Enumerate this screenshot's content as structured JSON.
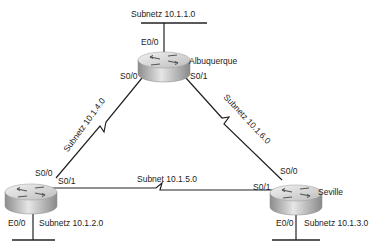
{
  "diagram": {
    "type": "network-topology",
    "colors": {
      "line": "#222222",
      "router_top": "#d8d8d8",
      "router_side": "#a8a8a8",
      "text": "#222222"
    },
    "routers": [
      {
        "id": "albuquerque",
        "name": "Albuquerque"
      },
      {
        "id": "yosemite",
        "name": ""
      },
      {
        "id": "seville",
        "name": "Seville"
      }
    ],
    "interfaces": {
      "albuquerque_e00": "E0/0",
      "albuquerque_s00": "S0/0",
      "albuquerque_s01": "S0/1",
      "left_s00": "S0/0",
      "left_s01": "S0/1",
      "left_e00": "E0/0",
      "seville_s00": "S0/0",
      "seville_s01": "S0/1",
      "seville_e00": "E0/0"
    },
    "subnets": {
      "top_lan": "Subnetz 10.1.1.0",
      "left_serial": "Subnetz 10.1.4.0",
      "right_serial": "Subnetz 10.1.6.0",
      "bottom_serial": "Subnet 10.1.5.0",
      "left_lan": "Subnetz 10.1.2.0",
      "right_lan": "Subnetz 10.1.3.0"
    }
  }
}
